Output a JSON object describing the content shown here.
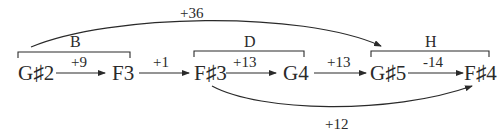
{
  "diagram": {
    "notes": [
      {
        "id": "n1",
        "label": "G♯2"
      },
      {
        "id": "n2",
        "label": "F3"
      },
      {
        "id": "n3",
        "label": "F♯3"
      },
      {
        "id": "n4",
        "label": "G4"
      },
      {
        "id": "n5",
        "label": "G♯5"
      },
      {
        "id": "n6",
        "label": "F♯4"
      }
    ],
    "edges": [
      {
        "from": "n1",
        "to": "n2",
        "label": "+9"
      },
      {
        "from": "n2",
        "to": "n3",
        "label": "+1"
      },
      {
        "from": "n3",
        "to": "n4",
        "label": "+13"
      },
      {
        "from": "n4",
        "to": "n5",
        "label": "+13"
      },
      {
        "from": "n5",
        "to": "n6",
        "label": "-14"
      }
    ],
    "arcs": [
      {
        "from": "B",
        "to": "H",
        "label": "+36"
      },
      {
        "from": "n3",
        "to": "n6",
        "label": "+12"
      }
    ],
    "groups": [
      {
        "label": "B"
      },
      {
        "label": "D"
      },
      {
        "label": "H"
      }
    ]
  }
}
